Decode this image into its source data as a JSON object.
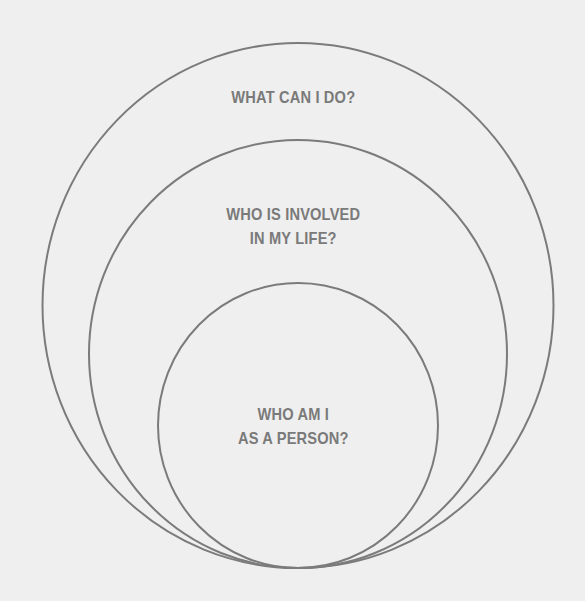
{
  "diagram": {
    "type": "nested-ellipses",
    "stroke_color": "#7b7b7b",
    "background_color": "#efefef",
    "text_color": "#7a7a7a",
    "rings": [
      {
        "name": "outer",
        "label_lines": [
          "WHAT CAN I DO?"
        ]
      },
      {
        "name": "middle",
        "label_lines": [
          "WHO IS INVOLVED",
          "IN MY LIFE?"
        ]
      },
      {
        "name": "inner",
        "label_lines": [
          "WHO AM I",
          "AS A PERSON?"
        ]
      }
    ]
  }
}
